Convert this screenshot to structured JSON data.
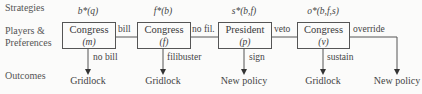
{
  "rows": {
    "strategies": "Strategies",
    "players_line1": "Players &",
    "players_line2": "Preferences",
    "outcomes": "Outcomes"
  },
  "strategies": [
    "b*(q)",
    "f*(b)",
    "s*(b,f)",
    "o*(b,f,s)"
  ],
  "players": [
    {
      "name": "Congress",
      "sub": "(m)"
    },
    {
      "name": "Congress",
      "sub": "(f)"
    },
    {
      "name": "President",
      "sub": "(p)"
    },
    {
      "name": "Congress",
      "sub": "(v)"
    }
  ],
  "horizontal_edges": [
    "bill",
    "no fil.",
    "veto",
    "override"
  ],
  "vertical_edges": [
    "no bill",
    "filibuster",
    "sign",
    "sustain"
  ],
  "outcomes": [
    "Gridlock",
    "Gridlock",
    "New policy",
    "Gridlock",
    "New policy"
  ],
  "colors": {
    "line": "#555555",
    "background": "#fbfbfa",
    "text": "#3a3a3a"
  }
}
